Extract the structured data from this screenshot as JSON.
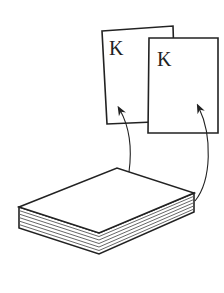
{
  "diagram": {
    "cards": [
      {
        "label": "K"
      },
      {
        "label": "K"
      }
    ],
    "deck": {
      "layers": 6
    },
    "colors": {
      "stroke": "#222222",
      "fill": "#ffffff"
    }
  }
}
